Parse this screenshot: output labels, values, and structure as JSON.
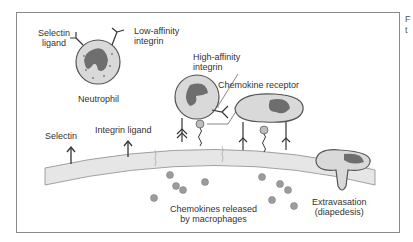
{
  "figure": {
    "labels": {
      "selectin_ligand": [
        "Selectin",
        "ligand"
      ],
      "low_affinity_integrin": [
        "Low-affinity",
        "integrin"
      ],
      "neutrophil": "Neutrophil",
      "high_affinity_integrin": [
        "High-affinity",
        "integrin"
      ],
      "chemokine_receptor": "Chemokine receptor",
      "selectin": "Selectin",
      "integrin_ligand": "Integrin ligand",
      "chemokines": [
        "Chemokines released",
        "by macrophages"
      ],
      "extravasation": [
        "Extravasation",
        "(diapedesis)"
      ]
    },
    "colors": {
      "border": "#8a8a8a",
      "cell_fill": "#d9d9d9",
      "cell_outline": "#555555",
      "nucleus": "#6e6e6e",
      "endothelium": "#e6e6e6",
      "chemokine": "#9c9c9c",
      "text": "#333333"
    }
  },
  "side_text": [
    "F",
    "t"
  ]
}
